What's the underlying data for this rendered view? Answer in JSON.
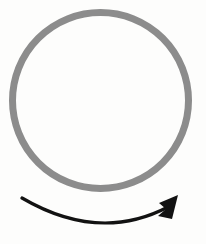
{
  "figure": {
    "description": "A gray circular outline with a black curved arrow beneath it indicating clockwise rotation",
    "background_color": "#fdfdfc",
    "width": 206,
    "height": 244
  },
  "circle": {
    "name": "circle-outline",
    "center_x": 100.5,
    "center_y": 100.5,
    "radius": 88,
    "stroke_color": "#8c8c8c",
    "stroke_width": 7,
    "fill": "none"
  },
  "arrow": {
    "name": "rotation-arrow",
    "color": "#121212",
    "stroke_width": 3.2,
    "direction": "clockwise",
    "tail_x": 22,
    "tail_y": 198,
    "control_x": 100,
    "control_y": 243,
    "tip_x": 178,
    "tip_y": 196,
    "head_length": 24,
    "head_width": 17,
    "path": "M 22 198 Q 99 243 168 207",
    "head_points": "178,195 159,203 166,209 158,216 172,219"
  }
}
